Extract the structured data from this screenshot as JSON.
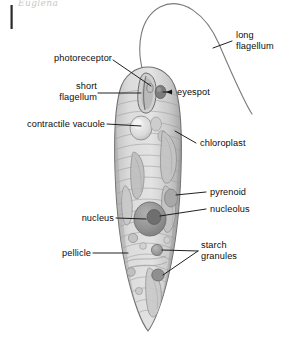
{
  "figure": {
    "artifact_text": "Euglena",
    "background_color": "#ffffff",
    "ink_color": "#111111",
    "cell_fill": "#d7d7d7",
    "cell_outline": "#6f6f6f",
    "organelle_dark": "#8e8e8e",
    "organelle_mid": "#b5b5b5",
    "organelle_light": "#e6e6e6"
  },
  "labels": [
    {
      "id": "photoreceptor",
      "text": "photoreceptor",
      "side": "left"
    },
    {
      "id": "short-flagellum",
      "line1": "short",
      "line2": "flagellum",
      "side": "left"
    },
    {
      "id": "contractile-vacuole",
      "text": "contractile vacuole",
      "side": "left"
    },
    {
      "id": "nucleus",
      "text": "nucleus",
      "side": "left"
    },
    {
      "id": "pellicle",
      "text": "pellicle",
      "side": "left"
    },
    {
      "id": "long-flagellum",
      "line1": "long",
      "line2": "flagellum",
      "side": "right"
    },
    {
      "id": "eyespot",
      "text": "eyespot",
      "side": "right"
    },
    {
      "id": "chloroplast",
      "text": "chloroplast",
      "side": "right"
    },
    {
      "id": "pyrenoid",
      "text": "pyrenoid",
      "side": "right"
    },
    {
      "id": "nucleolus",
      "text": "nucleolus",
      "side": "right"
    },
    {
      "id": "starch-granules",
      "line1": "starch",
      "line2": "granules",
      "side": "right"
    }
  ],
  "label_text": {
    "photoreceptor": "photoreceptor",
    "short_flagellum_1": "short",
    "short_flagellum_2": "flagellum",
    "contractile_vacuole": "contractile vacuole",
    "nucleus": "nucleus",
    "pellicle": "pellicle",
    "long_flagellum_1": "long",
    "long_flagellum_2": "flagellum",
    "eyespot": "eyespot",
    "chloroplast": "chloroplast",
    "pyrenoid": "pyrenoid",
    "nucleolus": "nucleolus",
    "starch_granules_1": "starch",
    "starch_granules_2": "granules"
  }
}
